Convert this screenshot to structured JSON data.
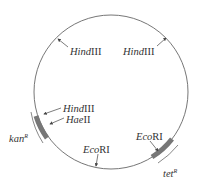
{
  "diagram": {
    "type": "plasmid-map",
    "colors": {
      "circle": "#666666",
      "gene": "#777777",
      "text": "#333333",
      "background": "#ffffff"
    },
    "sites": [
      {
        "id": "hindiii-1",
        "italic": "Hind",
        "roman": "III"
      },
      {
        "id": "hindiii-2",
        "italic": "Hind",
        "roman": "III"
      },
      {
        "id": "hindiii-3",
        "italic": "Hind",
        "roman": "III"
      },
      {
        "id": "haeii",
        "italic": "Hae",
        "roman": "II"
      },
      {
        "id": "ecori-1",
        "italic": "Eco",
        "roman": "RI"
      },
      {
        "id": "ecori-2",
        "italic": "Eco",
        "roman": "RI"
      }
    ],
    "genes": [
      {
        "id": "kan",
        "italic": "kan",
        "sup": "R"
      },
      {
        "id": "tet",
        "italic": "tet",
        "sup": "R"
      }
    ]
  }
}
